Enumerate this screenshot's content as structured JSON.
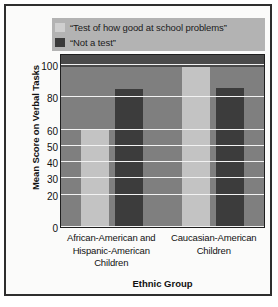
{
  "chart_data": {
    "type": "bar",
    "title": "",
    "xlabel": "Ethnic Group",
    "ylabel": "Mean Score on Verbal Tasks",
    "categories": [
      "African-American and Hispanic-American Children",
      "Caucasian-American Children"
    ],
    "series": [
      {
        "name": "“Test of how good at school problems”",
        "color": "#c3c3c3",
        "values": [
          60,
          100
        ]
      },
      {
        "name": "“Not a test”",
        "color": "#3c3c3c",
        "values": [
          85,
          86
        ]
      }
    ],
    "ylim": [
      0,
      105
    ],
    "yticks": [
      0,
      20,
      30,
      40,
      50,
      60,
      80,
      100
    ],
    "ytick_labels": [
      "0",
      "20",
      "30",
      "40",
      "50",
      "60",
      "80",
      "100"
    ],
    "grid": true,
    "legend_position": "top"
  },
  "legend": {
    "entries": [
      {
        "label": "“Test of how good at school problems”",
        "swatch": "light-gray-swatch"
      },
      {
        "label": "“Not a test”",
        "swatch": "dark-gray-swatch"
      }
    ]
  },
  "axes": {
    "y_title": "Mean Score on Verbal Tasks",
    "x_title": "Ethnic Group",
    "y_tick_labels": [
      "100",
      "80",
      "60",
      "50",
      "40",
      "30",
      "20",
      "0"
    ],
    "x_group_labels": [
      [
        "African-American and",
        "Hispanic-American",
        "Children"
      ],
      [
        "Caucasian-American",
        "Children"
      ]
    ]
  },
  "colors": {
    "plot_background": "#7f7f7f",
    "plot_top_band": "#4a4a4a",
    "gridline": "#f2f2f2",
    "legend_background": "#b3b3b3",
    "bar_light": "#c3c3c3",
    "bar_dark": "#3c3c3c",
    "frame": "#2e2e2e",
    "page_background": "#fbfbfa"
  }
}
